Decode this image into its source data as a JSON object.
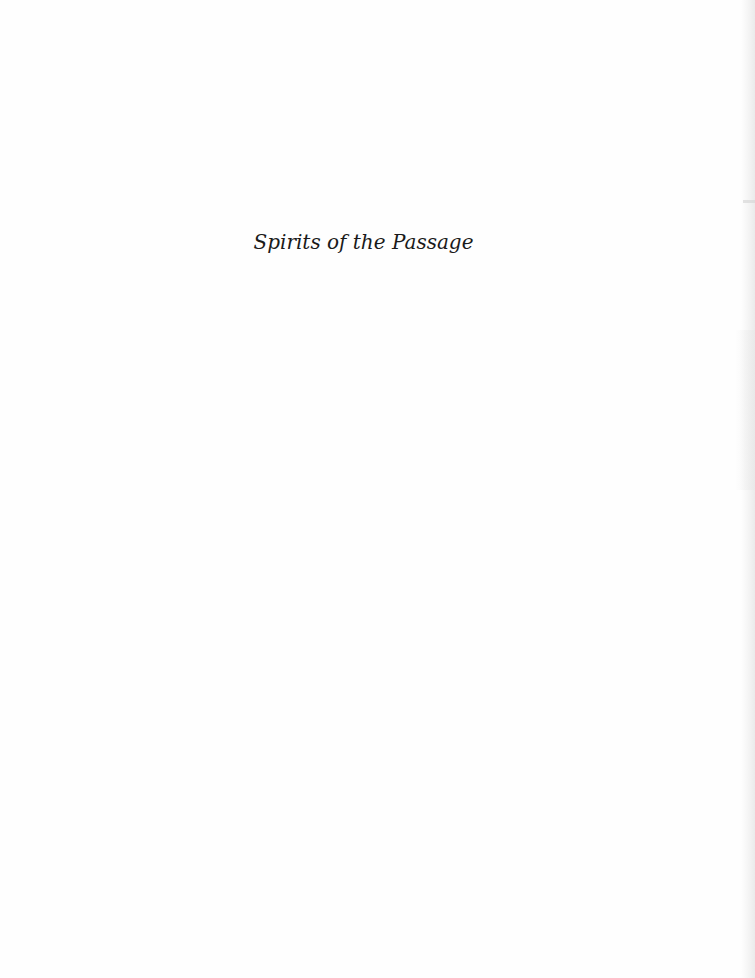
{
  "page": {
    "type": "half-title page",
    "title": "Spirits of the Passage",
    "background_color": "#fefefe",
    "text_color": "#1a1a1a"
  }
}
